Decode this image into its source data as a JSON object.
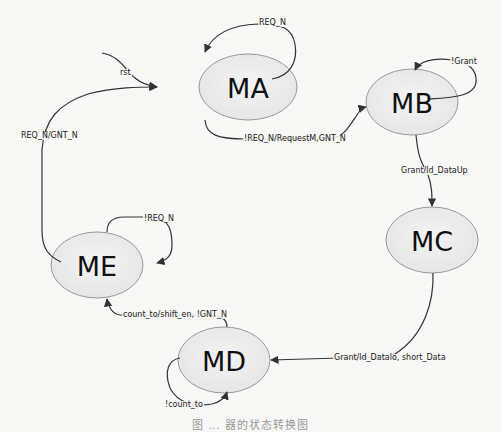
{
  "diagram": {
    "type": "state-machine",
    "colors": {
      "state_fill": "#ececec",
      "state_stroke": "#9a9a9a",
      "edge": "#333333",
      "text": "#111111"
    },
    "states": [
      {
        "id": "MA",
        "label": "MA"
      },
      {
        "id": "MB",
        "label": "MB"
      },
      {
        "id": "MC",
        "label": "MC"
      },
      {
        "id": "MD",
        "label": "MD"
      },
      {
        "id": "ME",
        "label": "ME"
      }
    ],
    "transitions": [
      {
        "from": "start",
        "to": "MA",
        "label": "rst"
      },
      {
        "from": "MA",
        "to": "MA",
        "label": "REQ_N"
      },
      {
        "from": "MA",
        "to": "MB",
        "label": "!REQ_N/RequestM,GNT_N"
      },
      {
        "from": "MB",
        "to": "MB",
        "label": "!Grant"
      },
      {
        "from": "MB",
        "to": "MC",
        "label": "Grant/ld_DataUp"
      },
      {
        "from": "MC",
        "to": "MD",
        "label": "Grant/ld_Datalo, short_Data"
      },
      {
        "from": "MD",
        "to": "MD",
        "label": "!count_to"
      },
      {
        "from": "MD",
        "to": "ME",
        "label": "count_to/shift_en, !GNT_N"
      },
      {
        "from": "ME",
        "to": "ME",
        "label": "!REQ_N"
      },
      {
        "from": "ME",
        "to": "MA",
        "label": "REQ_N/GNT_N"
      }
    ],
    "caption": "图 … 器的状态转换图"
  }
}
